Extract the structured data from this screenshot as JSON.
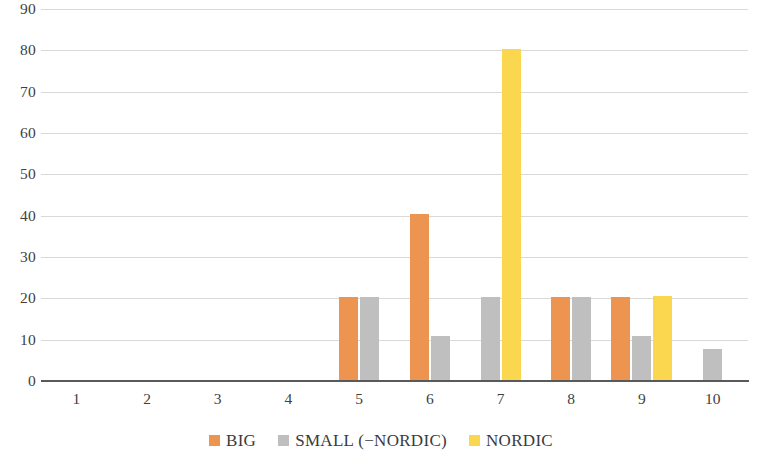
{
  "chart_data": {
    "type": "bar",
    "title": "",
    "subtitle": "",
    "xlabel": "",
    "ylabel": "",
    "categories": [
      "1",
      "2",
      "3",
      "4",
      "5",
      "6",
      "7",
      "8",
      "9",
      "10"
    ],
    "series": [
      {
        "name": "BIG",
        "color": "#ED9450",
        "values": [
          0,
          0,
          0,
          0,
          20.3,
          40.5,
          0,
          20.3,
          20.3,
          0
        ]
      },
      {
        "name": "SMALL (−NORDIC)",
        "color": "#BFBFBF",
        "values": [
          0,
          0,
          0,
          0,
          20.3,
          11.0,
          20.3,
          20.3,
          11.0,
          7.8
        ]
      },
      {
        "name": "NORDIC",
        "color": "#FAD74E",
        "values": [
          0,
          0,
          0,
          0,
          0,
          0,
          80.3,
          0,
          20.6,
          0
        ]
      }
    ],
    "ylim": [
      0,
      90
    ],
    "yticks": [
      0,
      10,
      20,
      30,
      40,
      50,
      60,
      70,
      80,
      90
    ],
    "ytick_labels": [
      "0",
      "10",
      "20",
      "30",
      "40",
      "50",
      "60",
      "70",
      "80",
      "90"
    ],
    "grid": true,
    "grid_axis": "y",
    "legend": true,
    "legend_position": "bottom",
    "legend_entries": [
      {
        "label": "BIG",
        "color": "#ED9450",
        "icon": "legend-swatch-orange"
      },
      {
        "label": "SMALL (−NORDIC)",
        "color": "#BFBFBF",
        "icon": "legend-swatch-gray"
      },
      {
        "label": "NORDIC",
        "color": "#FAD74E",
        "icon": "legend-swatch-yellow"
      }
    ],
    "background_color": "#FFFFFF",
    "gridline_color": "#D9D9D9",
    "axis_color": "#595959"
  }
}
